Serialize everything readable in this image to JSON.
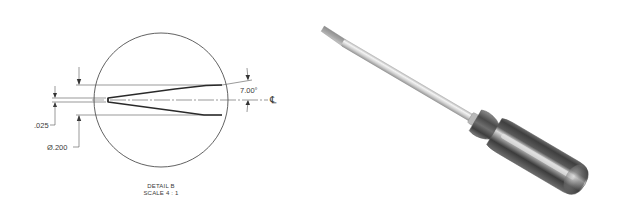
{
  "detail_view": {
    "caption": {
      "title": "DETAIL B",
      "scale": "SCALE 4 : 1"
    },
    "dimensions": {
      "slot_width": ".025",
      "body_diameter": "Ø.200",
      "taper_angle": "7.00°",
      "centerline_symbol": "℄"
    },
    "colors": {
      "line": "#3a3a3a",
      "thin_line": "#555555",
      "background": "#ffffff"
    }
  },
  "render_view": {
    "subject": "flat-head screwdriver",
    "colors": {
      "shaft_light": "#f2f2f2",
      "shaft_mid": "#c9c9c9",
      "shaft_dark": "#8e8e8e",
      "handle_dark": "#4a4a4a",
      "handle_mid": "#7a7a7a",
      "handle_light": "#d8d8d8"
    }
  }
}
